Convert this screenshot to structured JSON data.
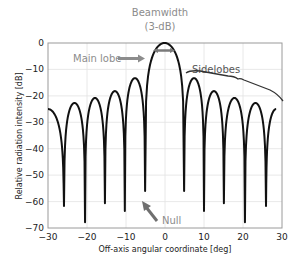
{
  "chart_data": {
    "type": "line",
    "title": "",
    "xlabel": "Off-axis angular coordinate [deg]",
    "ylabel": "Relative radiation intensity [dB]",
    "xlim": [
      -30,
      30
    ],
    "ylim": [
      -70,
      0
    ],
    "xticks": [
      -30,
      -20,
      -10,
      0,
      10,
      20,
      30
    ],
    "yticks": [
      0,
      -10,
      -20,
      -30,
      -40,
      -50,
      -60,
      -70
    ],
    "xtick_labels": [
      "−30",
      "−20",
      "−10",
      "0",
      "10",
      "20",
      "30"
    ],
    "ytick_labels": [
      "0",
      "−10",
      "−20",
      "−30",
      "−40",
      "−50",
      "−60",
      "−70"
    ],
    "grid": true,
    "legend": null,
    "series": [
      {
        "name": "Radiation pattern",
        "color": "#111111",
        "main_lobe": {
          "center_deg": 0,
          "peak_db": 0,
          "null_left_deg": -5.1,
          "null_right_deg": 4.9
        },
        "nulls": [
          {
            "x": -25.9,
            "y": -61.7
          },
          {
            "x": -20.5,
            "y": -67.8
          },
          {
            "x": -15.4,
            "y": -60.6
          },
          {
            "x": -10.3,
            "y": -63.6
          },
          {
            "x": -5.1,
            "y": -56
          },
          {
            "x": 4.9,
            "y": -56
          },
          {
            "x": 10.0,
            "y": -63.6
          },
          {
            "x": 15.1,
            "y": -60.6
          },
          {
            "x": 20.5,
            "y": -67.8
          },
          {
            "x": 25.9,
            "y": -61.7
          }
        ],
        "sidelobe_peaks": [
          {
            "x": -28.7,
            "y": -25
          },
          {
            "x": -23.2,
            "y": -22.7
          },
          {
            "x": -18.0,
            "y": -20.8
          },
          {
            "x": -12.8,
            "y": -18.2
          },
          {
            "x": -7.7,
            "y": -13.3
          },
          {
            "x": 7.5,
            "y": -13.3
          },
          {
            "x": 12.6,
            "y": -18.2
          },
          {
            "x": 17.8,
            "y": -20.8
          },
          {
            "x": 23.2,
            "y": -22.7
          },
          {
            "x": 28.5,
            "y": -25
          }
        ]
      }
    ],
    "annotations": [
      {
        "text": "Beamwidth",
        "text2": "(3-dB)",
        "target": "main lobe top width at -3 dB"
      },
      {
        "text": "Main lobe",
        "arrow": "right",
        "target": "main lobe"
      },
      {
        "text": "Sidelobes",
        "bracket": true,
        "target": "right sidelobes"
      },
      {
        "text": "Null",
        "arrow": "up-left",
        "target": "null at about -5 deg"
      }
    ]
  },
  "labels": {
    "beamwidth_line1": "Beamwidth",
    "beamwidth_line2": "(3-dB)",
    "main_lobe": "Main lobe",
    "sidelobes": "Sidelobes",
    "null": "Null",
    "xlabel": "Off-axis angular coordinate [deg]",
    "ylabel": "Relative radiation intensity [dB]",
    "xticks": [
      "−30",
      "−20",
      "−10",
      "0",
      "10",
      "20",
      "30"
    ],
    "yticks": [
      "0",
      "−10",
      "−20",
      "−30",
      "−40",
      "−50",
      "−60",
      "−70"
    ]
  },
  "colors": {
    "curve": "#111111",
    "annotation_gray": "#8c8c8c",
    "arrow_gray": "#7a7a7a",
    "grid": "#e2e2e2",
    "frame": "#9a9a9a"
  }
}
